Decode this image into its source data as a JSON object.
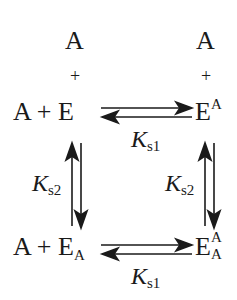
{
  "diagram": {
    "type": "reaction-scheme",
    "nodes": {
      "top_left": {
        "ligand_top": "A",
        "plus_top": "+",
        "left": "A + E",
        "enzyme": "E"
      },
      "top_right": {
        "ligand_top": "A",
        "plus_top": "+",
        "base": "E",
        "superscript": "A"
      },
      "bottom_left": {
        "left": "A + E",
        "subscript": "A"
      },
      "bottom_right": {
        "base": "E",
        "superscript": "A",
        "subscript": "A"
      }
    },
    "constants": {
      "top_horizontal": {
        "base": "K",
        "sub": "s1"
      },
      "bottom_horizontal": {
        "base": "K",
        "sub": "s1"
      },
      "left_vertical": {
        "base": "K",
        "sub": "s2"
      },
      "right_vertical": {
        "base": "K",
        "sub": "s2"
      }
    },
    "arrows": [
      {
        "from": "E",
        "to": "E^A",
        "kind": "equilibrium-horizontal"
      },
      {
        "from": "E_A",
        "to": "E^A_A",
        "kind": "equilibrium-horizontal"
      },
      {
        "from": "E",
        "to": "E_A",
        "kind": "equilibrium-vertical"
      },
      {
        "from": "E^A",
        "to": "E^A_A",
        "kind": "equilibrium-vertical"
      }
    ]
  }
}
